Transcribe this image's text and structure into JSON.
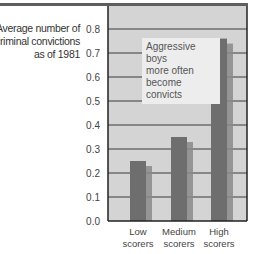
{
  "chart_data": {
    "type": "bar",
    "title": "",
    "ylabel": "Average number of criminal convictions as of 1981",
    "ylabel_lines": [
      "Average number of",
      "criminal convictions",
      "as of 1981"
    ],
    "xlabel": "",
    "categories": [
      "Low scorers",
      "Medium scorers",
      "High scorers"
    ],
    "category_lines": [
      [
        "Low",
        "scorers"
      ],
      [
        "Medium",
        "scorers"
      ],
      [
        "High",
        "scorers"
      ]
    ],
    "values": [
      0.25,
      0.35,
      0.76
    ],
    "ylim": [
      0,
      0.8
    ],
    "yticks": [
      "0.0",
      "0.1",
      "0.2",
      "0.3",
      "0.4",
      "0.5",
      "0.6",
      "0.7",
      "0.8"
    ],
    "grid": true,
    "legend": "none",
    "annotation": [
      "Aggressive boys",
      "more often",
      "become convicts"
    ],
    "colors": {
      "bar": "#6e6e6e",
      "bar_shadow": "#8a8a8a",
      "plot_bg": "#d4d4d4",
      "grid": "#3a3a3a"
    }
  }
}
